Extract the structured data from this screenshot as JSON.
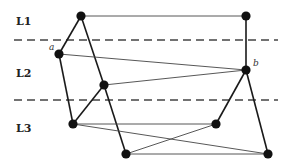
{
  "layers": [
    {
      "id": "L1",
      "label": "L1",
      "label_x": 16,
      "label_y": 25
    },
    {
      "id": "L2",
      "label": "L2",
      "label_x": 16,
      "label_y": 77
    },
    {
      "id": "L3",
      "label": "L3",
      "label_x": 16,
      "label_y": 132
    }
  ],
  "separators": [
    {
      "y": 40,
      "x1": 14,
      "x2": 278
    },
    {
      "y": 100,
      "x1": 14,
      "x2": 278
    }
  ],
  "nodes": [
    {
      "id": "n1",
      "x": 81,
      "y": 16,
      "layer": "L1",
      "label": ""
    },
    {
      "id": "n2",
      "x": 246,
      "y": 16,
      "layer": "L1",
      "label": ""
    },
    {
      "id": "a",
      "x": 59,
      "y": 54,
      "layer": "L2",
      "label": "a"
    },
    {
      "id": "b",
      "x": 246,
      "y": 70,
      "layer": "L2",
      "label": "b"
    },
    {
      "id": "n5",
      "x": 104,
      "y": 85,
      "layer": "L2",
      "label": ""
    },
    {
      "id": "n6",
      "x": 73,
      "y": 124,
      "layer": "L3",
      "label": ""
    },
    {
      "id": "n7",
      "x": 216,
      "y": 124,
      "layer": "L3",
      "label": ""
    },
    {
      "id": "n8",
      "x": 126,
      "y": 154,
      "layer": "L3",
      "label": ""
    },
    {
      "id": "n9",
      "x": 268,
      "y": 154,
      "layer": "L3",
      "label": ""
    }
  ],
  "edges": [
    {
      "from": "n1",
      "to": "n2",
      "weight": "thin"
    },
    {
      "from": "n1",
      "to": "a",
      "weight": "thick"
    },
    {
      "from": "n1",
      "to": "n5",
      "weight": "thick"
    },
    {
      "from": "n5",
      "to": "n8",
      "weight": "thick"
    },
    {
      "from": "n2",
      "to": "b",
      "weight": "thick"
    },
    {
      "from": "a",
      "to": "b",
      "weight": "thin"
    },
    {
      "from": "a",
      "to": "n6",
      "weight": "thick"
    },
    {
      "from": "n5",
      "to": "b",
      "weight": "thin"
    },
    {
      "from": "n5",
      "to": "n6",
      "weight": "thick"
    },
    {
      "from": "b",
      "to": "n7",
      "weight": "thick"
    },
    {
      "from": "b",
      "to": "n9",
      "weight": "thick"
    },
    {
      "from": "n6",
      "to": "n7",
      "weight": "thin"
    },
    {
      "from": "n6",
      "to": "n9",
      "weight": "thin"
    },
    {
      "from": "n8",
      "to": "n7",
      "weight": "thin"
    },
    {
      "from": "n8",
      "to": "n9",
      "weight": "thin"
    }
  ],
  "node_labels": {
    "a": {
      "text": "a",
      "dx": -10,
      "dy": -4
    },
    "b": {
      "text": "b",
      "dx": 7,
      "dy": -4
    }
  }
}
